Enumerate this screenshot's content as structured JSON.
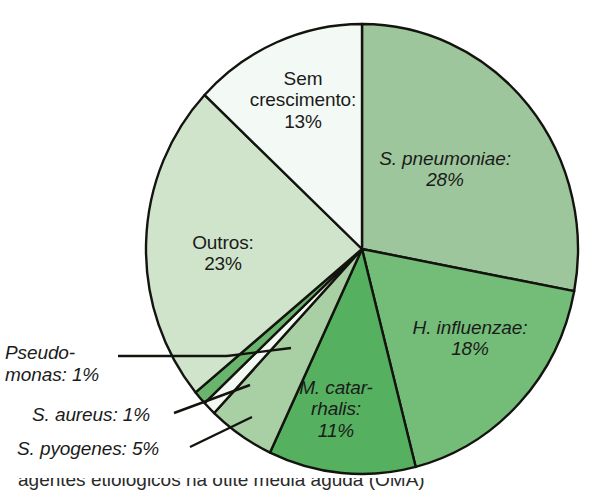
{
  "figure": {
    "background": "#ffffff",
    "caption_partial": "agentes etiológicos na otite média aguda (OMA)"
  },
  "chart_data": {
    "type": "pie",
    "title": "",
    "unit": "%",
    "start_angle_deg": -90,
    "direction": "clockwise",
    "total": 100,
    "categories": [
      "S. pneumoniae",
      "H. influenzae",
      "M. catarrhalis",
      "S. pyogenes",
      "S. aureus",
      "Pseudomonas",
      "Outros",
      "Sem crescimento"
    ],
    "values": [
      28,
      18,
      11,
      5,
      1,
      1,
      23,
      13
    ],
    "colors": [
      "#9ec69c",
      "#74bd78",
      "#55b05f",
      "#a8d0a4",
      "#f2f8f2",
      "#69b56e",
      "#cfe4cb",
      "#f3f9f4"
    ],
    "stroke": "#14140f",
    "legend_position": "inside-and-callouts"
  },
  "slice_labels": [
    {
      "name": "s-pneumoniae",
      "text": "S. pneumoniae:\n28%",
      "italic": true,
      "left": 345,
      "top": 148,
      "width": 200
    },
    {
      "name": "h-influenzae",
      "text": "H. influenzae:\n18%",
      "italic": true,
      "left": 385,
      "top": 317,
      "width": 170
    },
    {
      "name": "m-catarrhalis",
      "text": "M. catar-\nrhalis:\n11%",
      "italic": true,
      "left": 281,
      "top": 377,
      "width": 110
    },
    {
      "name": "outros",
      "text": "Outros:\n23%",
      "italic": false,
      "left": 158,
      "top": 232,
      "width": 130
    },
    {
      "name": "sem-crescimento",
      "text": "Sem\ncrescimento:\n13%",
      "italic": false,
      "left": 228,
      "top": 68,
      "width": 150
    }
  ],
  "callout_labels": [
    {
      "name": "pseudomonas",
      "text": "Pseudo-\nmonas: 1%",
      "left": 5,
      "top": 342
    },
    {
      "name": "s-aureus",
      "text": "S. aureus: 1%",
      "left": 32,
      "top": 404
    },
    {
      "name": "s-pyogenes",
      "text": "S. pyogenes: 5%",
      "left": 17,
      "top": 438
    }
  ],
  "geometry": {
    "cx": 362,
    "cy": 249,
    "rx": 216,
    "ry": 225
  }
}
